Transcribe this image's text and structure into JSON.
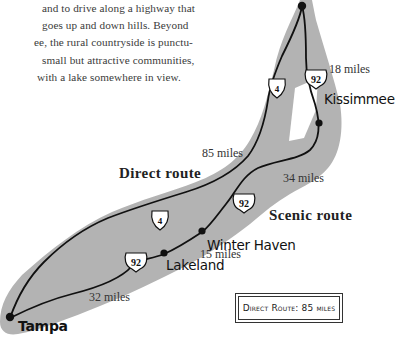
{
  "paragraph": {
    "lines": [
      "and to drive along a highway that",
      "goes up and down hills. Beyond",
      "ee, the rural countryside is punctu-",
      "small but attractive communities,",
      "with a lake somewhere in view."
    ]
  },
  "map": {
    "band_color": "#b3b3b3",
    "road_color": "#111111",
    "cities": {
      "kissimmee": "Kissimmee",
      "winter_haven": "Winter Haven",
      "lakeland": "Lakeland",
      "tampa": "Tampa"
    },
    "routes": {
      "direct": "Direct route",
      "scenic": "Scenic route"
    },
    "distances": {
      "top_segment": "18 miles",
      "direct_total": "85 miles",
      "kissimmee_to_winter_haven": "34 miles",
      "winter_haven_to_lakeland": "15 miles",
      "lakeland_to_tampa": "32 miles"
    },
    "shields": {
      "i4_upper": "4",
      "i4_lower": "4",
      "us92_upper": "92",
      "us92_middle": "92",
      "us92_lower": "92"
    }
  },
  "legend": {
    "text": "Direct Route: 85 miles"
  }
}
